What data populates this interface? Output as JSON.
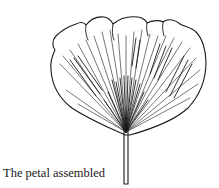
{
  "figure": {
    "caption": "The petal assembled",
    "line_color": "#1a1a1a"
  }
}
